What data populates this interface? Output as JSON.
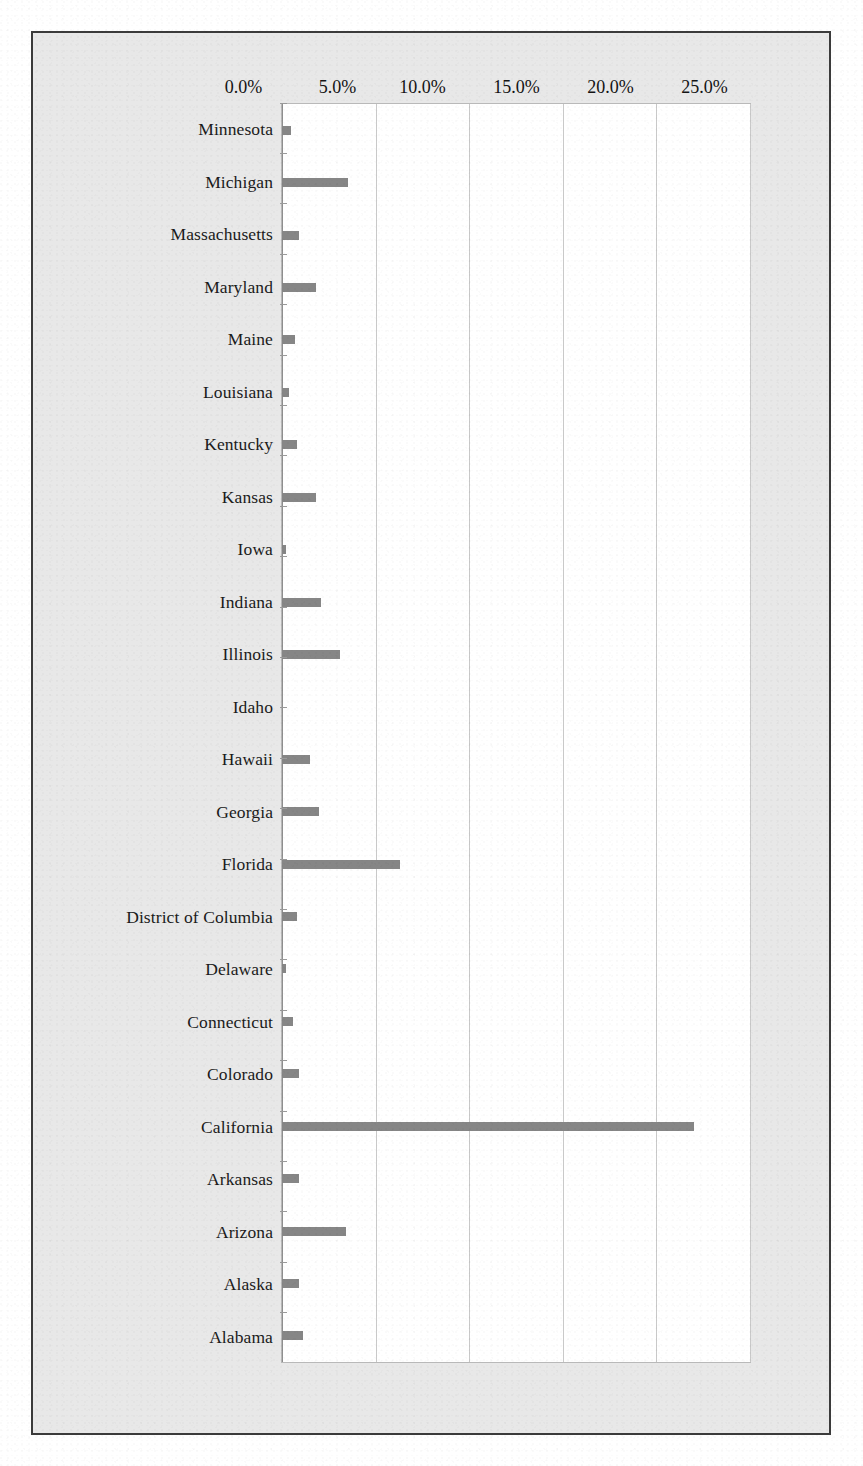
{
  "page": {
    "orientation": "landscape-rotated",
    "background_color": "#e8e8e8",
    "frame_color": "#3b3b3b"
  },
  "chart_data": {
    "type": "bar",
    "title": "",
    "subtitle": "",
    "xlabel": "",
    "ylabel": "",
    "orientation": "vertical-bars-on-rotated-page",
    "grid": true,
    "legend": "none",
    "bar_color": "#868686",
    "gridline_color": "#c9c9c9",
    "ylim": [
      0,
      25
    ],
    "yticks": [
      0,
      5,
      10,
      15,
      20,
      25
    ],
    "ytick_labels": [
      "0.0%",
      "5.0%",
      "10.0%",
      "15.0%",
      "20.0%",
      "25.0%"
    ],
    "value_unit": "percent",
    "categories": [
      "Minnesota",
      "Michigan",
      "Massachusetts",
      "Maryland",
      "Maine",
      "Louisiana",
      "Kentucky",
      "Kansas",
      "Iowa",
      "Indiana",
      "Illinois",
      "Idaho",
      "Hawaii",
      "Georgia",
      "Florida",
      "District of Columbia",
      "Delaware",
      "Connecticut",
      "Colorado",
      "California",
      "Arkansas",
      "Arizona",
      "Alaska",
      "Alabama"
    ],
    "values": [
      0.5,
      3.5,
      0.9,
      1.8,
      0.7,
      0.4,
      0.8,
      1.8,
      0.2,
      2.1,
      3.1,
      0.0,
      1.5,
      2.0,
      6.3,
      0.8,
      0.2,
      0.6,
      0.9,
      22.0,
      0.9,
      3.4,
      0.9,
      1.1
    ]
  }
}
